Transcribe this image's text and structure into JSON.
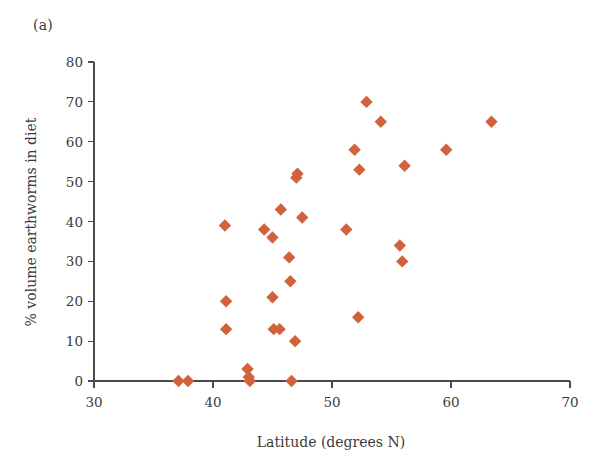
{
  "figure": {
    "panel_label": "(a)",
    "background_color": "#ffffff"
  },
  "chart_data": {
    "type": "scatter",
    "title": "",
    "subtitle": "",
    "xlabel": "Latitude (degrees N)",
    "ylabel": "% volume earthworms in diet",
    "xlim": [
      30,
      70
    ],
    "ylim": [
      0,
      80
    ],
    "xticks": [
      30,
      40,
      50,
      60,
      70
    ],
    "yticks": [
      0,
      10,
      20,
      30,
      40,
      50,
      60,
      70,
      80
    ],
    "xtick_labels": [
      "30",
      "40",
      "50",
      "60",
      "70"
    ],
    "ytick_labels": [
      "0",
      "10",
      "20",
      "30",
      "40",
      "50",
      "60",
      "70",
      "80"
    ],
    "grid": false,
    "legend": null,
    "legend_position": "none",
    "marker": {
      "shape": "diamond",
      "color": "#d2623c",
      "size_px": 9
    },
    "series": [
      {
        "name": "Tawny owl diet",
        "color": "#d2623c",
        "points": [
          {
            "x": 37.1,
            "y": 0
          },
          {
            "x": 37.9,
            "y": 0
          },
          {
            "x": 41.0,
            "y": 39
          },
          {
            "x": 41.1,
            "y": 20
          },
          {
            "x": 41.1,
            "y": 13
          },
          {
            "x": 42.9,
            "y": 3
          },
          {
            "x": 43.0,
            "y": 1
          },
          {
            "x": 43.1,
            "y": 0
          },
          {
            "x": 44.3,
            "y": 38
          },
          {
            "x": 45.0,
            "y": 36
          },
          {
            "x": 45.0,
            "y": 21
          },
          {
            "x": 45.1,
            "y": 13
          },
          {
            "x": 45.6,
            "y": 13
          },
          {
            "x": 45.7,
            "y": 43
          },
          {
            "x": 46.4,
            "y": 31
          },
          {
            "x": 46.5,
            "y": 25
          },
          {
            "x": 46.6,
            "y": 0
          },
          {
            "x": 46.9,
            "y": 10
          },
          {
            "x": 47.0,
            "y": 51
          },
          {
            "x": 47.1,
            "y": 52
          },
          {
            "x": 47.5,
            "y": 41
          },
          {
            "x": 51.2,
            "y": 38
          },
          {
            "x": 51.9,
            "y": 58
          },
          {
            "x": 52.2,
            "y": 16
          },
          {
            "x": 52.3,
            "y": 53
          },
          {
            "x": 52.9,
            "y": 70
          },
          {
            "x": 54.1,
            "y": 65
          },
          {
            "x": 55.7,
            "y": 34
          },
          {
            "x": 55.9,
            "y": 30
          },
          {
            "x": 56.1,
            "y": 54
          },
          {
            "x": 59.6,
            "y": 58
          },
          {
            "x": 63.4,
            "y": 65
          }
        ]
      }
    ]
  }
}
